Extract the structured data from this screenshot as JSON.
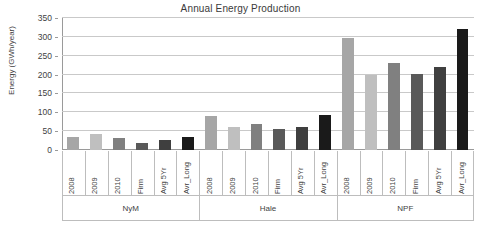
{
  "chart_data": {
    "type": "bar",
    "title": "Annual Energy Production",
    "xlabel": "",
    "ylabel": "Energy (GWh/year)",
    "ylim": [
      0,
      350
    ],
    "yticks": [
      0,
      50,
      100,
      150,
      200,
      250,
      300,
      350
    ],
    "ytick_labels": [
      "0",
      "50",
      "100",
      "150",
      "200",
      "250",
      "300",
      "350"
    ],
    "grid": true,
    "legend": "none",
    "categories": [
      "2008",
      "2009",
      "2010",
      "Firm",
      "Avg 5Yr",
      "Avr_Long"
    ],
    "groups": [
      "NyM",
      "Hale",
      "NPF"
    ],
    "series": [
      {
        "name": "NyM",
        "values": [
          35,
          42,
          32,
          18,
          27,
          35
        ]
      },
      {
        "name": "Hale",
        "values": [
          90,
          60,
          70,
          55,
          62,
          92
        ]
      },
      {
        "name": "NPF",
        "values": [
          297,
          200,
          232,
          201,
          220,
          321
        ]
      }
    ],
    "bar_colors": [
      "#a6a6a6",
      "#bfbfbf",
      "#808080",
      "#595959",
      "#3f3f3f",
      "#1a1a1a"
    ],
    "grid_color": "#c9c9c9",
    "axis_color": "#9a9a9a"
  }
}
